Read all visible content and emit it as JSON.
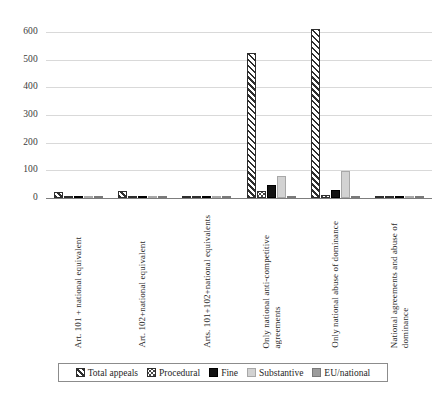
{
  "chart_data": {
    "type": "bar",
    "title": "",
    "subtitle": "",
    "xlabel": "",
    "ylabel": "",
    "ylim": [
      0,
      650
    ],
    "yticks": [
      0,
      100,
      200,
      300,
      400,
      500,
      600
    ],
    "ytick_labels": [
      "0",
      "100",
      "200",
      "300",
      "400",
      "500",
      "600"
    ],
    "grid": true,
    "legend_position": "bottom",
    "categories": [
      "Art. 101 + national equivalent",
      "Art. 102+national equivalent",
      "Arts. 101+102+national equivalents",
      "Only national anti-competitive\nagreements",
      "Only national abuse of dominance",
      "National agreements and abuse of\ndominance"
    ],
    "series": [
      {
        "name": "Total appeals",
        "pattern": "diagonal-hatch",
        "values": [
          22,
          25,
          1,
          525,
          612,
          3
        ]
      },
      {
        "name": "Procedural",
        "pattern": "dotted",
        "values": [
          3,
          2,
          0,
          25,
          10,
          1
        ]
      },
      {
        "name": "Fine",
        "pattern": "solid-black",
        "values": [
          2,
          2,
          0,
          47,
          28,
          4
        ]
      },
      {
        "name": "Substantive",
        "pattern": "light-grey",
        "values": [
          8,
          5,
          0,
          78,
          98,
          2
        ]
      },
      {
        "name": "EU/national",
        "pattern": "mid-grey",
        "values": [
          1,
          1,
          0,
          1,
          1,
          1
        ]
      }
    ],
    "legend": [
      {
        "label": "Total appeals",
        "swatch": "diagonal-hatch"
      },
      {
        "label": "Procedural",
        "swatch": "dotted"
      },
      {
        "label": "Fine",
        "swatch": "solid-black"
      },
      {
        "label": "Substantive",
        "swatch": "light-grey"
      },
      {
        "label": "EU/national",
        "swatch": "mid-grey"
      }
    ],
    "colors": {
      "hatch": "#2e2e2e",
      "fine": "#121212",
      "substantive": "#d2d2d2",
      "eu_national": "#9c9c9c",
      "gridline": "#d9d9d9",
      "axis": "#7d7d7d"
    }
  }
}
